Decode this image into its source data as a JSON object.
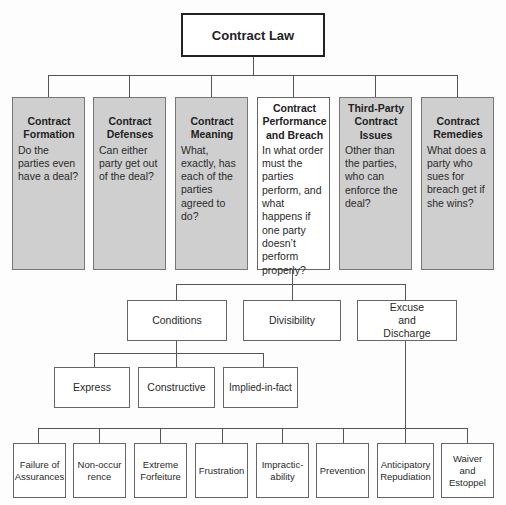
{
  "root": {
    "label": "Contract Law"
  },
  "categories": [
    {
      "title": "Contract Formation",
      "desc": "Do the parties even have a deal?",
      "shaded": true
    },
    {
      "title": "Contract Defenses",
      "desc": "Can either party get out of the deal?",
      "shaded": true
    },
    {
      "title": "Contract Meaning",
      "desc": "What, exactly, has each of the parties agreed to do?",
      "shaded": true
    },
    {
      "title": "Contract Performance and Breach",
      "desc": "In what order must the parties perform, and what happens if one party doesn’t perform properly?",
      "shaded": false
    },
    {
      "title": "Third-Party Contract Issues",
      "desc": "Other than the parties, who can enforce the deal?",
      "shaded": true
    },
    {
      "title": "Contract Remedies",
      "desc": "What does a party who sues for breach get if she wins?",
      "shaded": true
    }
  ],
  "performance_children": [
    {
      "label": "Conditions"
    },
    {
      "label": "Divisibility"
    },
    {
      "label": "Excuse and Discharge"
    }
  ],
  "conditions_children": [
    {
      "label": "Express"
    },
    {
      "label": "Constructive"
    },
    {
      "label": "Implied-in-fact"
    }
  ],
  "excuse_children": [
    {
      "label": "Failure of Assurances"
    },
    {
      "label": "Non-occurrence"
    },
    {
      "label": "Extreme Forfeiture"
    },
    {
      "label": "Frustration"
    },
    {
      "label": "Impractic-ability"
    },
    {
      "label": "Prevention"
    },
    {
      "label": "Anticipatory Repudiation"
    },
    {
      "label": "Waiver and Estoppel"
    }
  ],
  "colors": {
    "shaded_box": "#cfcfcf",
    "line": "#555555",
    "root_border": "#222222"
  }
}
